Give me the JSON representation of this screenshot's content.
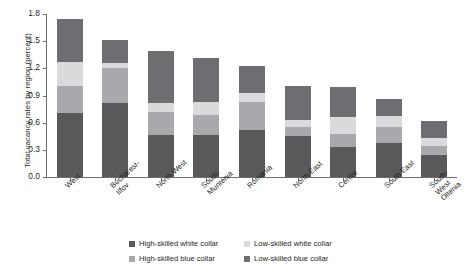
{
  "chart_data": {
    "type": "bar",
    "subtype": "stacked-vertical",
    "title": "",
    "xlabel": "",
    "ylabel": "Total vacancy rates by region (percent)",
    "ylim": [
      0.0,
      1.8
    ],
    "yticks": [
      "0.0",
      "0.3",
      "0.6",
      "0.9",
      "1.2",
      "1.5",
      "1.8"
    ],
    "ytick_values": [
      0.0,
      0.3,
      0.6,
      0.9,
      1.2,
      1.5,
      1.8
    ],
    "grid": false,
    "legend_position": "bottom",
    "categories": [
      "West",
      "Bucharest-\nIlfov",
      "North West",
      "South-\nMuntenia",
      "Romania",
      "North East",
      "Centre",
      "South East",
      "South-West\nOltenia"
    ],
    "series": [
      {
        "name": "High-skilled white collar",
        "color": "#58595b",
        "values": [
          0.71,
          0.82,
          0.46,
          0.46,
          0.52,
          0.45,
          0.33,
          0.38,
          0.24
        ]
      },
      {
        "name": "High-skilled blue collar",
        "color": "#a7a9ac",
        "values": [
          0.29,
          0.38,
          0.26,
          0.23,
          0.31,
          0.1,
          0.14,
          0.17,
          0.1
        ]
      },
      {
        "name": "Low-skilled white collar",
        "color": "#d9dadb",
        "values": [
          0.27,
          0.06,
          0.1,
          0.14,
          0.1,
          0.08,
          0.19,
          0.12,
          0.09
        ]
      },
      {
        "name": "Low-skilled blue collar",
        "color": "#6d6e71",
        "values": [
          0.48,
          0.25,
          0.57,
          0.49,
          0.3,
          0.38,
          0.33,
          0.19,
          0.19
        ]
      }
    ],
    "totals": [
      1.75,
      1.51,
      1.39,
      1.32,
      1.24,
      1.01,
      0.99,
      0.86,
      0.62
    ]
  },
  "legend": {
    "entries": [
      {
        "label": "High-skilled white collar",
        "color": "#58595b"
      },
      {
        "label": "Low-skilled white collar",
        "color": "#d9dadb"
      },
      {
        "label": "High-skilled blue collar",
        "color": "#a7a9ac"
      },
      {
        "label": "Low-skilled blue collar",
        "color": "#6d6e71"
      }
    ]
  }
}
